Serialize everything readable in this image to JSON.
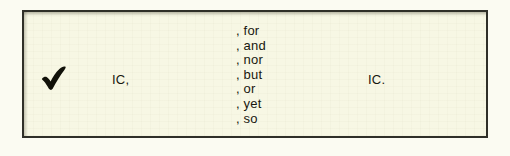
{
  "figure": {
    "name": "comma-coordinating-conjunction-pattern",
    "panel_background": "#f7f7e4",
    "border_color": "#2f2f28",
    "text_color": "#17170f",
    "page_background": "#fbfbf2"
  },
  "status": {
    "icon": "check-mark-icon",
    "meaning": "correct"
  },
  "pattern": {
    "first_clause": "IC,",
    "second_clause": "IC."
  },
  "conjunctions": [
    {
      "label": ", for"
    },
    {
      "label": ", and"
    },
    {
      "label": ", nor"
    },
    {
      "label": ", but"
    },
    {
      "label": ", or"
    },
    {
      "label": ", yet"
    },
    {
      "label": ", so"
    }
  ]
}
